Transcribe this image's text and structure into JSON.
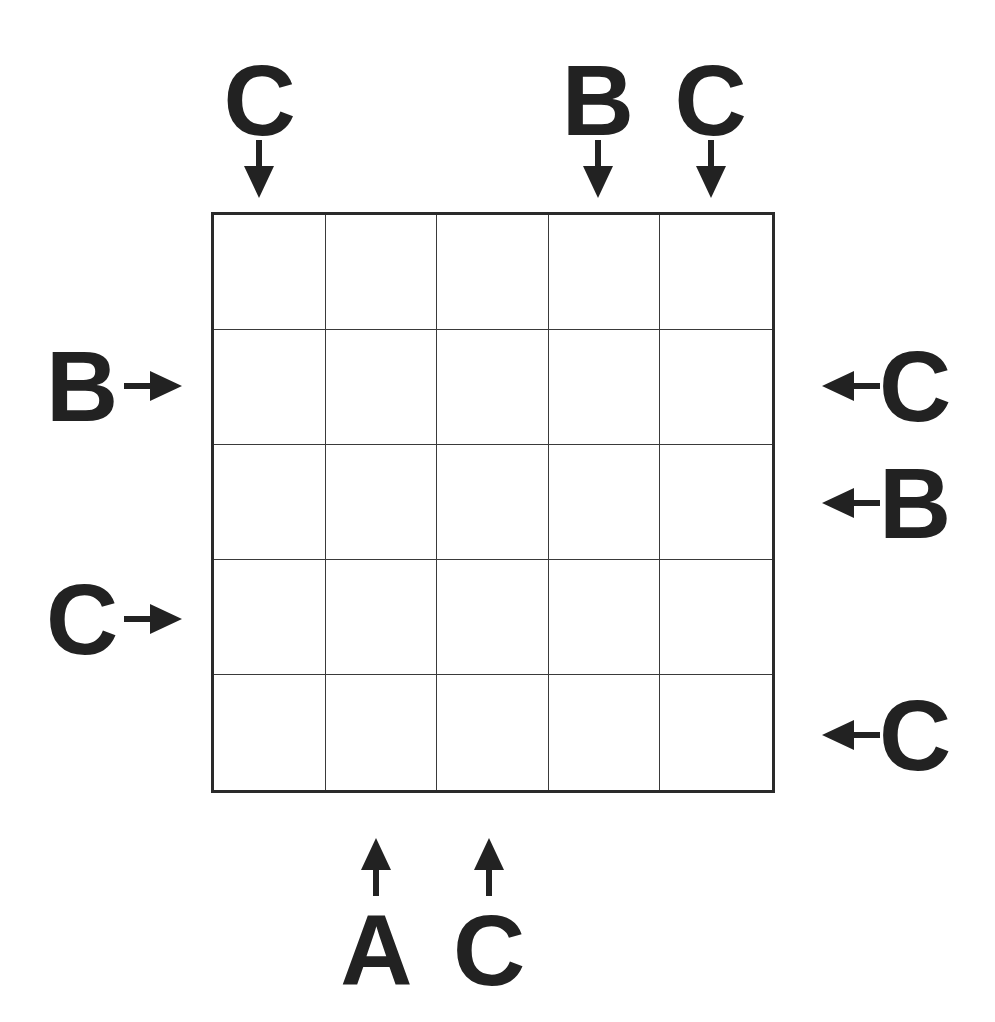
{
  "puzzle": {
    "type": "Easy as ABC",
    "size": 5,
    "letters": [
      "A",
      "B",
      "C"
    ],
    "grid": [
      [
        "",
        "",
        "",
        "",
        ""
      ],
      [
        "",
        "",
        "",
        "",
        ""
      ],
      [
        "",
        "",
        "",
        "",
        ""
      ],
      [
        "",
        "",
        "",
        "",
        ""
      ],
      [
        "",
        "",
        "",
        "",
        ""
      ]
    ],
    "clues": {
      "top": [
        "C",
        "",
        "",
        "B",
        "C"
      ],
      "bottom": [
        "",
        "A",
        "C",
        "",
        ""
      ],
      "left": [
        "",
        "B",
        "",
        "C",
        ""
      ],
      "right": [
        "",
        "C",
        "B",
        "",
        "C"
      ]
    }
  },
  "colors": {
    "ink": "#222222",
    "background": "#ffffff"
  }
}
